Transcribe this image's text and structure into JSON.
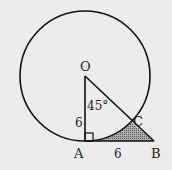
{
  "diagram": {
    "points": {
      "O": {
        "label": "O"
      },
      "A": {
        "label": "A"
      },
      "B": {
        "label": "B"
      },
      "C": {
        "label": "C"
      }
    },
    "angle_label": "45°",
    "side_OA_label": "6",
    "side_AB_label": "6",
    "colors": {
      "stroke": "#111111",
      "shade": "#8a8a8a",
      "background": "#ececec"
    }
  }
}
